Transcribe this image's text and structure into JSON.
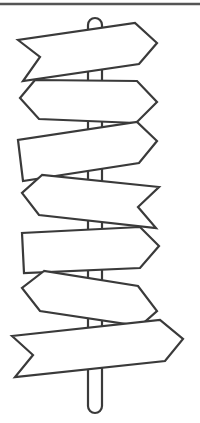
{
  "illustration": {
    "subject": "signpost-with-seven-blank-arrow-signs",
    "stroke_color": "#3a3a3a",
    "fill_color": "#ffffff",
    "background": "#ffffff",
    "stroke_width": 2.2,
    "top_rule": {
      "y": 4,
      "x1": 0,
      "x2": 200
    },
    "pole": {
      "x_left": 88,
      "x_right": 102,
      "top_y": 25,
      "bottom_y": 413
    },
    "signs": [
      {
        "name": "sign-1",
        "direction": "right",
        "points": "18,40 40,57 23,81 139,64 157,43 135,23"
      },
      {
        "name": "sign-2",
        "direction": "right",
        "points": "35,80 20,98 39,119 136,123 157,102 137,81"
      },
      {
        "name": "sign-3",
        "direction": "right",
        "points": "18,140 23,181 139,163 157,141 137,122"
      },
      {
        "name": "sign-4",
        "direction": "left",
        "points": "42,175 22,193 39,215 156,228 138,207 159,187"
      },
      {
        "name": "sign-5",
        "direction": "right",
        "points": "22,233 24,273 140,268 159,246 140,227"
      },
      {
        "name": "sign-6",
        "direction": "left",
        "points": "44,271 22,288 40,311 140,326 157,311 138,286"
      },
      {
        "name": "sign-7",
        "direction": "right",
        "points": "12,336 33,355 15,377 165,361 183,339 160,320"
      }
    ]
  }
}
